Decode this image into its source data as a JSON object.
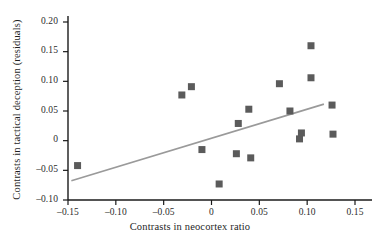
{
  "chart_data": {
    "type": "scatter",
    "title": "",
    "xlabel": "Contrasts in neocortex ratio",
    "ylabel": "Contrasts in tactical deception (residuals)",
    "xlim": [
      -0.16,
      0.175
    ],
    "ylim": [
      -0.1,
      0.21
    ],
    "grid": false,
    "legend": null,
    "xticks": [
      -0.15,
      -0.1,
      -0.05,
      0,
      0.05,
      0.1,
      0.15
    ],
    "xtick_labels": [
      "–0.15",
      "–0.10",
      "–0.05",
      "0",
      "0.05",
      "0.10",
      "0.15"
    ],
    "yticks": [
      0.2,
      0.15,
      0.1,
      0.05,
      0,
      -0.05,
      -0.1
    ],
    "ytick_labels": [
      "0.20",
      "0.15",
      "0.10",
      "0.05",
      "0",
      "–0.05",
      "–0.10"
    ],
    "marker": {
      "shape": "square",
      "color": "#5b5b5b",
      "size_px": 7
    },
    "points": [
      {
        "x": -0.14,
        "y": -0.042
      },
      {
        "x": -0.031,
        "y": 0.077
      },
      {
        "x": -0.021,
        "y": 0.091
      },
      {
        "x": -0.01,
        "y": -0.015
      },
      {
        "x": 0.008,
        "y": -0.073
      },
      {
        "x": 0.026,
        "y": -0.022
      },
      {
        "x": 0.028,
        "y": 0.029
      },
      {
        "x": 0.039,
        "y": 0.053
      },
      {
        "x": 0.041,
        "y": -0.029
      },
      {
        "x": 0.071,
        "y": 0.096
      },
      {
        "x": 0.082,
        "y": 0.05
      },
      {
        "x": 0.092,
        "y": 0.003
      },
      {
        "x": 0.094,
        "y": 0.013
      },
      {
        "x": 0.104,
        "y": 0.106
      },
      {
        "x": 0.104,
        "y": 0.16
      },
      {
        "x": 0.126,
        "y": 0.06
      },
      {
        "x": 0.127,
        "y": 0.011
      }
    ],
    "trendline": {
      "type": "linear-fit",
      "color": "#9a9a9a",
      "x_start": -0.1465,
      "y_start": -0.0675,
      "x_end": 0.1175,
      "y_end": 0.0615
    },
    "axes": {
      "line_color": "#1a1a1a",
      "spines": [
        "left",
        "bottom"
      ]
    }
  }
}
